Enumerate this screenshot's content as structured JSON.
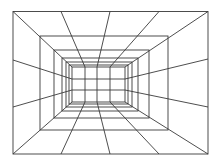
{
  "diagram": {
    "type": "one-point-perspective-tunnel-grid",
    "stroke_color": "#3a3a3a",
    "background_color": "#ffffff",
    "canvas": {
      "width": 216,
      "height": 166
    },
    "nested_frames": [
      {
        "x1": 13,
        "y1": 11.5,
        "x2": 208,
        "y2": 154
      },
      {
        "x1": 40,
        "y1": 36,
        "x2": 168,
        "y2": 130
      },
      {
        "x1": 54,
        "y1": 50,
        "x2": 149,
        "y2": 118
      },
      {
        "x1": 62,
        "y1": 58,
        "x2": 138,
        "y2": 111
      },
      {
        "x1": 66,
        "y1": 62,
        "x2": 132,
        "y2": 107
      },
      {
        "x1": 69,
        "y1": 65,
        "x2": 128,
        "y2": 104
      },
      {
        "x1": 72,
        "y1": 67,
        "x2": 125,
        "y2": 102
      }
    ],
    "back_wall": {
      "verticals_x": [
        85,
        97,
        110
      ],
      "horizontals_y": [
        79,
        90
      ],
      "x1": 72,
      "y1": 67,
      "x2": 125,
      "y2": 102
    },
    "radial_lines": [
      {
        "name": "corner-top-left",
        "from": [
          13,
          11.5
        ],
        "to": [
          72,
          67
        ]
      },
      {
        "name": "corner-top-right",
        "from": [
          208,
          11.5
        ],
        "to": [
          125,
          67
        ]
      },
      {
        "name": "corner-bottom-left",
        "from": [
          13,
          154
        ],
        "to": [
          72,
          102
        ]
      },
      {
        "name": "corner-bottom-right",
        "from": [
          208,
          154
        ],
        "to": [
          125,
          102
        ]
      },
      {
        "name": "ceiling-1",
        "from": [
          61,
          11.5
        ],
        "to": [
          85,
          67
        ]
      },
      {
        "name": "ceiling-2",
        "from": [
          110,
          11.5
        ],
        "to": [
          97,
          67
        ]
      },
      {
        "name": "ceiling-3",
        "from": [
          159,
          11.5
        ],
        "to": [
          110,
          67
        ]
      },
      {
        "name": "floor-1",
        "from": [
          61,
          154
        ],
        "to": [
          85,
          102
        ]
      },
      {
        "name": "floor-2",
        "from": [
          110,
          154
        ],
        "to": [
          97,
          102
        ]
      },
      {
        "name": "floor-3",
        "from": [
          159,
          154
        ],
        "to": [
          110,
          102
        ]
      },
      {
        "name": "left-wall-1",
        "from": [
          13,
          60
        ],
        "to": [
          72,
          79
        ]
      },
      {
        "name": "left-wall-2",
        "from": [
          13,
          107
        ],
        "to": [
          72,
          90
        ]
      },
      {
        "name": "right-wall-1",
        "from": [
          208,
          59
        ],
        "to": [
          125,
          79
        ]
      },
      {
        "name": "right-wall-2",
        "from": [
          208,
          107
        ],
        "to": [
          125,
          90
        ]
      }
    ]
  }
}
